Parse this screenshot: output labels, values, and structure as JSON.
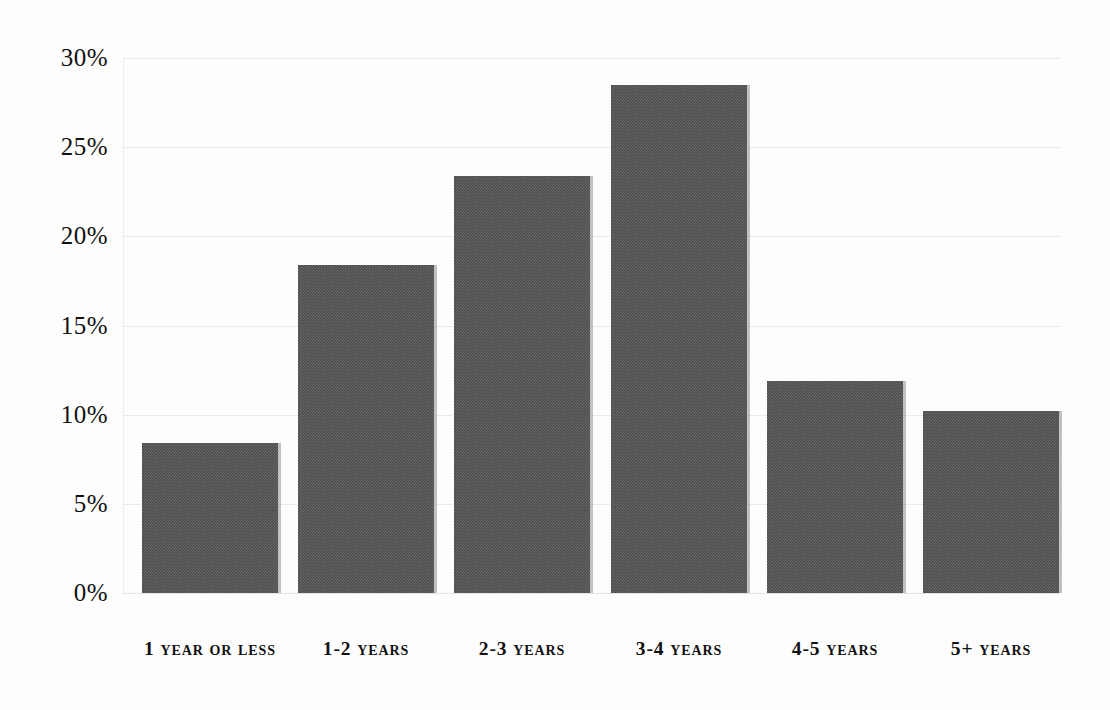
{
  "chart_data": {
    "type": "bar",
    "title": "",
    "subtitle": "",
    "xlabel": "",
    "ylabel": "",
    "categories": [
      "1 year or less",
      "1-2 years",
      "2-3 years",
      "3-4 years",
      "4-5 years",
      "5+ years"
    ],
    "values": [
      8.4,
      18.4,
      23.4,
      28.5,
      11.9,
      10.2
    ],
    "value_labels": [
      "8.4%",
      "18.4%",
      "23.4%",
      "28.5%",
      "11.9%",
      "10.2%"
    ],
    "ylim": [
      0,
      30
    ],
    "ytick_values": [
      0,
      5,
      10,
      15,
      20,
      25,
      30
    ],
    "ytick_labels": [
      "0%",
      "5%",
      "10%",
      "15%",
      "20%",
      "25%",
      "30%"
    ],
    "grid": true,
    "legend": false,
    "legend_position": "none",
    "bar_color": "#4c4c4c",
    "grid_color": "#e9e9e9",
    "background_color": "#fdfdfd",
    "text_color": "#111111"
  }
}
